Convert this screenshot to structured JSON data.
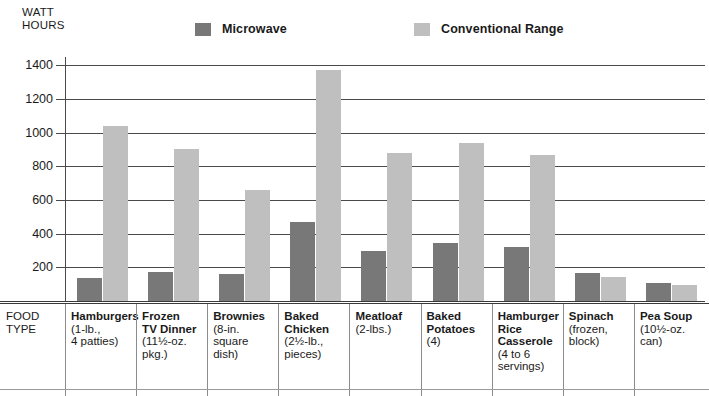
{
  "axis": {
    "y_title": "WATT\nHOURS",
    "ticks": [
      "1400",
      "1200",
      "1000",
      "800",
      "600",
      "400",
      "200"
    ]
  },
  "legend": {
    "microwave_label": "Microwave",
    "microwave_color": "#787878",
    "conventional_label": "Conventional Range",
    "conventional_color": "#bfbfbf"
  },
  "table": {
    "row_header": "FOOD\nTYPE"
  },
  "categories": [
    {
      "name": "Hamburgers",
      "sub": "(1-lb.,\n4 patties)"
    },
    {
      "name": "Frozen\nTV Dinner",
      "sub": "(11½-oz.\npkg.)"
    },
    {
      "name": "Brownies",
      "sub": "(8-in.\nsquare\ndish)"
    },
    {
      "name": "Baked\nChicken",
      "sub": "(2½-lb.,\npieces)"
    },
    {
      "name": "Meatloaf",
      "sub": "(2-lbs.)"
    },
    {
      "name": "Baked\nPotatoes",
      "sub": "(4)"
    },
    {
      "name": "Hamburger\nRice\nCasserole",
      "sub": "(4 to 6\nservings)"
    },
    {
      "name": "Spinach",
      "sub": "(frozen,\nblock)"
    },
    {
      "name": "Pea Soup",
      "sub": "(10½-oz.\ncan)"
    }
  ],
  "chart_data": {
    "type": "bar",
    "title": "",
    "xlabel": "FOOD TYPE",
    "ylabel": "WATT HOURS",
    "ylim": [
      0,
      1450
    ],
    "yticks": [
      200,
      400,
      600,
      800,
      1000,
      1200,
      1400
    ],
    "grid": true,
    "legend_position": "top",
    "categories": [
      "Hamburgers (1-lb., 4 patties)",
      "Frozen TV Dinner (11½-oz. pkg.)",
      "Brownies (8-in. square dish)",
      "Baked Chicken (2½-lb., pieces)",
      "Meatloaf (2-lbs.)",
      "Baked Potatoes (4)",
      "Hamburger Rice Casserole (4 to 6 servings)",
      "Spinach (frozen, block)",
      "Pea Soup (10½-oz. can)"
    ],
    "series": [
      {
        "name": "Microwave",
        "color": "#787878",
        "values": [
          135,
          175,
          160,
          470,
          300,
          345,
          320,
          165,
          110
        ]
      },
      {
        "name": "Conventional Range",
        "color": "#bfbfbf",
        "values": [
          1040,
          905,
          660,
          1370,
          880,
          940,
          870,
          145,
          95
        ]
      }
    ]
  }
}
